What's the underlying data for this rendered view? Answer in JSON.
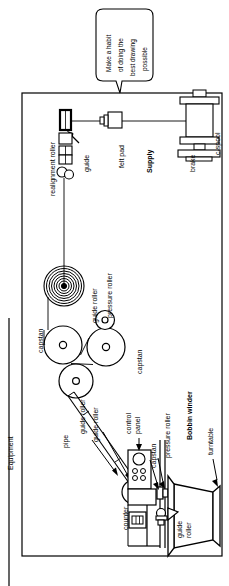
{
  "diagram": {
    "title": "Equipment",
    "outer_label": "Equipment",
    "speech_bubble": {
      "line1": "Make a habit",
      "line2": "of doing the",
      "line3": "best drawing",
      "line4": "possible"
    },
    "sections": [
      {
        "name": "Supply",
        "bold": true
      },
      {
        "name": "Bobbin winder",
        "bold": true
      }
    ],
    "labels": [
      {
        "id": "realignment-roller",
        "text": "realignment roller"
      },
      {
        "id": "guide",
        "text": "guide"
      },
      {
        "id": "felt-pad",
        "text": "felt pad"
      },
      {
        "id": "supply",
        "text": "Supply"
      },
      {
        "id": "brake",
        "text": "brake"
      },
      {
        "id": "c-spool",
        "text": "c-spool"
      },
      {
        "id": "capstan-upper",
        "text": "capstan"
      },
      {
        "id": "guide-roller-upper",
        "text": "guide roller"
      },
      {
        "id": "pressure-roller-upper",
        "text": "pressure roller"
      },
      {
        "id": "capstan-mid",
        "text": "capstan"
      },
      {
        "id": "guide-roller-a",
        "text": "guide roller"
      },
      {
        "id": "guide-roller-b",
        "text": "guide roller"
      },
      {
        "id": "pipe",
        "text": "pipe"
      },
      {
        "id": "control-panel",
        "text": "control\npanel"
      },
      {
        "id": "capstan-lower",
        "text": "capstan"
      },
      {
        "id": "pressure-roller-lower",
        "text": "pressure roller"
      },
      {
        "id": "bobbin-winder",
        "text": "Bobbin winder"
      },
      {
        "id": "turntable",
        "text": "turntable"
      },
      {
        "id": "counter",
        "text": "counter"
      },
      {
        "id": "guide-roller-bottom",
        "text": "guide\nroller"
      }
    ],
    "colors": {
      "stroke": "#000000",
      "background": "#ffffff",
      "fill_light": "#f2f2f2",
      "fill_none": "none"
    },
    "components": {
      "c_spool": "c-spool",
      "brake": "brake",
      "felt_pad": "felt pad",
      "guide_block": "guide",
      "realignment_roller": "realignment roller",
      "coil": "wire coil",
      "capstan_rollers": 3,
      "pressure_rollers": 2,
      "control_panel": "control panel",
      "counter": "counter",
      "turntable": "turntable"
    }
  }
}
